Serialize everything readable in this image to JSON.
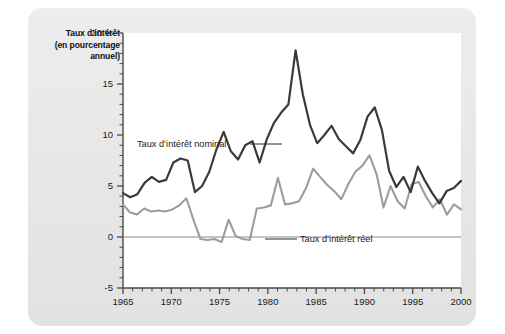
{
  "figure": {
    "title_lines": [
      "Taux d’intérêt",
      "(en pourcentage",
      "annuel)"
    ],
    "panel_color": "#e9e9e9",
    "plot_background": "#ffffff"
  },
  "chart_data": {
    "type": "line",
    "title": "Taux d’intérêt (en pourcentage annuel)",
    "xlabel": "",
    "ylabel": "Taux d’intérêt (en pourcentage annuel)",
    "xlim": [
      1965,
      2000
    ],
    "ylim": [
      -5,
      20
    ],
    "grid": false,
    "legend_position": "inline-annotations",
    "y_ticks": [
      {
        "value": 20,
        "label": "20 %"
      },
      {
        "value": 15,
        "label": "15"
      },
      {
        "value": 10,
        "label": "10"
      },
      {
        "value": 5,
        "label": "5"
      },
      {
        "value": 0,
        "label": "0"
      },
      {
        "value": -5,
        "label": "-5"
      }
    ],
    "y_minor_tick_step": 1,
    "x_ticks": [
      {
        "value": 1965,
        "label": "1965"
      },
      {
        "value": 1970,
        "label": "1970"
      },
      {
        "value": 1975,
        "label": "1975"
      },
      {
        "value": 1980,
        "label": "1980"
      },
      {
        "value": 1985,
        "label": "1985"
      },
      {
        "value": 1990,
        "label": "1990"
      },
      {
        "value": 1995,
        "label": "1995"
      },
      {
        "value": 2000,
        "label": "2000"
      }
    ],
    "x_minor_tick_step": 1,
    "zero_line": 0,
    "x": [
      1965,
      1966,
      1967,
      1968,
      1969,
      1970,
      1971,
      1972,
      1973,
      1974,
      1975,
      1976,
      1977,
      1978,
      1979,
      1980,
      1981,
      1982,
      1983,
      1984,
      1985,
      1986,
      1987,
      1988,
      1989,
      1990,
      1991,
      1992,
      1993,
      1994,
      1995,
      1996,
      1997,
      1998,
      1999,
      2000
    ],
    "series": [
      {
        "name": "Taux d’intérêt nominal",
        "color": "#3a3a3a",
        "annotation": "Taux d’intérêt nominal",
        "values": [
          4.3,
          3.9,
          4.2,
          5.3,
          5.9,
          5.4,
          5.6,
          7.3,
          7.7,
          7.5,
          4.4,
          5.0,
          6.4,
          8.6,
          10.3,
          8.4,
          7.6,
          9.0,
          9.4,
          7.3,
          9.6,
          11.2,
          12.2,
          13.0,
          18.3,
          14.0,
          11.0,
          9.2,
          10.0,
          10.9,
          9.6,
          8.9,
          8.2,
          9.5,
          11.8,
          12.7
        ]
      },
      {
        "name": "Taux d’intérêt réel",
        "color": "#9d9d9d",
        "annotation": "Taux d’intérêt réel",
        "values": [
          3.2,
          2.4,
          2.2,
          2.8,
          2.5,
          2.6,
          2.5,
          2.7,
          3.1,
          3.8,
          1.7,
          -0.2,
          -0.3,
          -0.2,
          -0.5,
          1.7,
          0.1,
          -0.2,
          -0.3,
          2.8,
          2.9,
          3.1,
          5.8,
          3.2,
          3.3,
          3.5,
          4.8,
          6.7,
          5.9,
          5.1,
          4.5,
          3.7,
          5.2,
          6.4,
          7.0,
          8.0
        ]
      }
    ],
    "series_tail": {
      "note": "values continue to 2000",
      "nominal_tail": [
        12.7,
        10.5,
        6.5,
        4.9,
        5.9,
        4.4,
        6.9,
        5.5,
        4.3,
        3.3,
        4.5,
        4.8,
        5.5
      ],
      "real_tail": [
        8.0,
        6.2,
        2.9,
        5.0,
        3.5,
        2.8,
        5.2,
        5.4,
        4.0,
        2.9,
        3.7,
        2.2,
        3.2,
        2.7
      ]
    },
    "annotations": [
      {
        "text": "Taux d’intérêt nominal",
        "leader": true
      },
      {
        "text": "Taux d’intérêt réel",
        "leader": true
      }
    ]
  }
}
